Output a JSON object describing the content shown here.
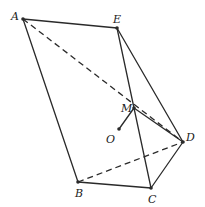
{
  "diagram": {
    "type": "geometry-solid",
    "points": {
      "A": {
        "label": "A",
        "x": 23,
        "y": 19
      },
      "E": {
        "label": "E",
        "x": 117,
        "y": 28
      },
      "M": {
        "label": "M",
        "x": 134,
        "y": 108
      },
      "O": {
        "label": "O",
        "x": 119,
        "y": 129
      },
      "D": {
        "label": "D",
        "x": 183,
        "y": 142
      },
      "B": {
        "label": "B",
        "x": 78,
        "y": 182
      },
      "C": {
        "label": "C",
        "x": 151,
        "y": 188
      }
    },
    "solid_edges": [
      [
        "A",
        "E"
      ],
      [
        "A",
        "B"
      ],
      [
        "B",
        "C"
      ],
      [
        "C",
        "D"
      ],
      [
        "E",
        "D"
      ],
      [
        "E",
        "C"
      ],
      [
        "M",
        "O"
      ],
      [
        "M",
        "D"
      ]
    ],
    "dashed_edges": [
      [
        "A",
        "D"
      ],
      [
        "B",
        "D"
      ]
    ]
  }
}
